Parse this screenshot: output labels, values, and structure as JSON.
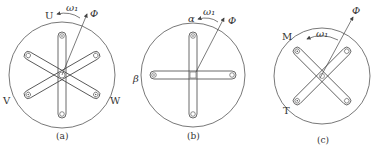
{
  "colors": {
    "stroke": "#444444",
    "text": "#333333",
    "background": "#ffffff"
  },
  "diagrams": [
    {
      "id": "a",
      "caption": "(a)",
      "description": "Three-phase winding U, V, W with rotating flux",
      "center": [
        62,
        75
      ],
      "radius": 53,
      "coil_angles_deg": [
        90,
        30,
        150
      ],
      "labels": {
        "top": "U",
        "left": "V",
        "right": "W",
        "omega": "ω₁",
        "flux": "Φ"
      }
    },
    {
      "id": "b",
      "caption": "(b)",
      "description": "Two-phase stationary winding α, β",
      "center": [
        193,
        75
      ],
      "radius": 52,
      "coil_angles_deg": [
        90,
        0
      ],
      "labels": {
        "top": "α",
        "left": "β",
        "omega": "ω₁",
        "flux": "Φ"
      }
    },
    {
      "id": "c",
      "caption": "(c)",
      "description": "Two-phase rotating winding M, T",
      "center": [
        322,
        76
      ],
      "radius": 48,
      "coil_angles_deg": [
        45,
        135
      ],
      "labels": {
        "top": "M",
        "bottom": "T",
        "omega": "ω₁",
        "flux": "Φ"
      }
    }
  ]
}
